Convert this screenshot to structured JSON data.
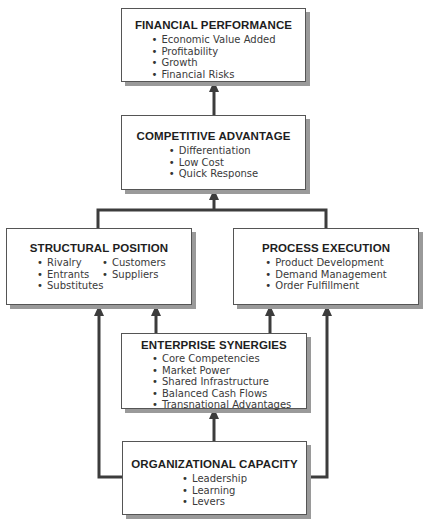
{
  "diagram": {
    "nodes": {
      "financial_performance": {
        "title": "FINANCIAL PERFORMANCE",
        "items": [
          "Economic Value Added",
          "Profitability",
          "Growth",
          "Financial Risks"
        ]
      },
      "competitive_advantage": {
        "title": "COMPETITIVE ADVANTAGE",
        "items": [
          "Differentiation",
          "Low Cost",
          "Quick Response"
        ]
      },
      "structural_position": {
        "title": "STRUCTURAL POSITION",
        "items_col1": [
          "Rivalry",
          "Entrants",
          "Substitutes"
        ],
        "items_col2": [
          "Customers",
          "Suppliers"
        ]
      },
      "process_execution": {
        "title": "PROCESS EXECUTION",
        "items": [
          "Product Development",
          "Demand Management",
          "Order Fulfillment"
        ]
      },
      "enterprise_synergies": {
        "title": "ENTERPRISE SYNERGIES",
        "items": [
          "Core Competencies",
          "Market Power",
          "Shared Infrastructure",
          "Balanced Cash Flows",
          "Transnational Advantages"
        ]
      },
      "organizational_capacity": {
        "title": "ORGANIZATIONAL CAPACITY",
        "items": [
          "Leadership",
          "Learning",
          "Levers"
        ]
      }
    },
    "edges": [
      {
        "from": "competitive_advantage",
        "to": "financial_performance"
      },
      {
        "from": "structural_position",
        "to": "competitive_advantage"
      },
      {
        "from": "process_execution",
        "to": "competitive_advantage"
      },
      {
        "from": "enterprise_synergies",
        "to": "structural_position"
      },
      {
        "from": "enterprise_synergies",
        "to": "process_execution"
      },
      {
        "from": "organizational_capacity",
        "to": "enterprise_synergies"
      },
      {
        "from": "organizational_capacity",
        "to": "structural_position"
      },
      {
        "from": "organizational_capacity",
        "to": "process_execution"
      }
    ],
    "colors": {
      "line": "#3c3c3c",
      "border": "#555555",
      "shadow": "#9a9a9a"
    }
  }
}
